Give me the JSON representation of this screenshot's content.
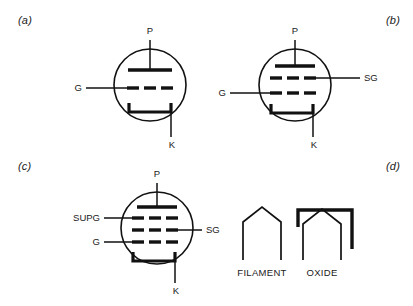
{
  "figure": {
    "background_color": "#ffffff",
    "ink_color": "#111111"
  },
  "panels": [
    {
      "id": "a",
      "label": "(a)",
      "device": "triode",
      "electrodes": [
        {
          "name": "plate",
          "label": "P",
          "position": "top"
        },
        {
          "name": "control-grid",
          "label": "G",
          "position": "left"
        },
        {
          "name": "cathode",
          "label": "K",
          "position": "bottom-right"
        }
      ],
      "grid_rows": 1
    },
    {
      "id": "b",
      "label": "(b)",
      "device": "tetrode",
      "electrodes": [
        {
          "name": "plate",
          "label": "P",
          "position": "top"
        },
        {
          "name": "screen-grid",
          "label": "SG",
          "position": "right"
        },
        {
          "name": "control-grid",
          "label": "G",
          "position": "left"
        },
        {
          "name": "cathode",
          "label": "K",
          "position": "bottom-right"
        }
      ],
      "grid_rows": 2
    },
    {
      "id": "c",
      "label": "(c)",
      "device": "pentode",
      "electrodes": [
        {
          "name": "plate",
          "label": "P",
          "position": "top"
        },
        {
          "name": "suppressor-grid",
          "label": "SUPG",
          "position": "left-upper"
        },
        {
          "name": "screen-grid",
          "label": "SG",
          "position": "right"
        },
        {
          "name": "control-grid",
          "label": "G",
          "position": "left-lower"
        },
        {
          "name": "cathode",
          "label": "K",
          "position": "bottom-right"
        }
      ],
      "grid_rows": 3
    },
    {
      "id": "d",
      "label": "(d)",
      "device": "cathode-types",
      "symbols": [
        {
          "name": "filament-symbol",
          "caption": "FILAMENT"
        },
        {
          "name": "oxide-symbol",
          "caption": "OXIDE"
        }
      ]
    }
  ],
  "labels": {
    "plate": "P",
    "grid": "G",
    "screen_grid": "SG",
    "suppressor_grid": "SUPG",
    "cathode": "K",
    "filament": "FILAMENT",
    "oxide": "OXIDE"
  }
}
